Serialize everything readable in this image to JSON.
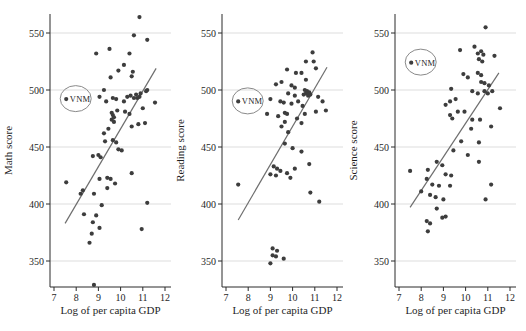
{
  "figure": {
    "width": 526,
    "height": 331,
    "background": "#ffffff",
    "dot_color": "#3d3d3d",
    "fit_line_color": "#6e6e6e",
    "grid_color": "#d9d9d9",
    "axis_color": "#2b2b2b",
    "text_color": "#1f1f1f",
    "annotation_circle_color": "#8a8a8a"
  },
  "chart_data": [
    {
      "type": "scatter",
      "ylabel": "Math score",
      "xlabel": "Log of per capita GDP",
      "xticks": [
        7,
        8,
        9,
        10,
        11,
        12
      ],
      "yticks": [
        350,
        400,
        450,
        500,
        550
      ],
      "xlim": [
        6.8,
        12.3
      ],
      "ylim": [
        327,
        567
      ],
      "grid": "horizontal",
      "legend": "none",
      "annotation": {
        "label": "VNM",
        "x": 7.55,
        "y": 492
      },
      "fit_line": {
        "x1": 7.5,
        "y1": 383,
        "x2": 11.6,
        "y2": 519
      },
      "points": [
        [
          7.55,
          419
        ],
        [
          7.55,
          492
        ],
        [
          8.2,
          409
        ],
        [
          8.3,
          412
        ],
        [
          8.35,
          391
        ],
        [
          8.6,
          366
        ],
        [
          8.7,
          374
        ],
        [
          8.75,
          384
        ],
        [
          8.75,
          442
        ],
        [
          8.8,
          329
        ],
        [
          8.8,
          409
        ],
        [
          8.9,
          532
        ],
        [
          8.9,
          390
        ],
        [
          9.0,
          443
        ],
        [
          9.05,
          379
        ],
        [
          9.05,
          422
        ],
        [
          9.05,
          494
        ],
        [
          9.1,
          441
        ],
        [
          9.15,
          399
        ],
        [
          9.25,
          500
        ],
        [
          9.25,
          462
        ],
        [
          9.3,
          455
        ],
        [
          9.35,
          490
        ],
        [
          9.4,
          414
        ],
        [
          9.4,
          423
        ],
        [
          9.45,
          466
        ],
        [
          9.5,
          536
        ],
        [
          9.55,
          422
        ],
        [
          9.55,
          511
        ],
        [
          9.6,
          480
        ],
        [
          9.6,
          474
        ],
        [
          9.65,
          478
        ],
        [
          9.65,
          493
        ],
        [
          9.65,
          456
        ],
        [
          9.7,
          476
        ],
        [
          9.7,
          472
        ],
        [
          9.75,
          418
        ],
        [
          9.8,
          454
        ],
        [
          9.8,
          492
        ],
        [
          9.85,
          482
        ],
        [
          9.9,
          517
        ],
        [
          9.9,
          448
        ],
        [
          10.05,
          447
        ],
        [
          10.15,
          490
        ],
        [
          10.15,
          522
        ],
        [
          10.2,
          481
        ],
        [
          10.3,
          494
        ],
        [
          10.4,
          532
        ],
        [
          10.4,
          479
        ],
        [
          10.45,
          495
        ],
        [
          10.5,
          427
        ],
        [
          10.5,
          468
        ],
        [
          10.5,
          512
        ],
        [
          10.55,
          516
        ],
        [
          10.6,
          493
        ],
        [
          10.6,
          548
        ],
        [
          10.7,
          496
        ],
        [
          10.75,
          493
        ],
        [
          10.8,
          470
        ],
        [
          10.85,
          494
        ],
        [
          10.85,
          564
        ],
        [
          10.9,
          497
        ],
        [
          10.95,
          378
        ],
        [
          11.0,
          484
        ],
        [
          11.1,
          471
        ],
        [
          11.15,
          499
        ],
        [
          11.2,
          401
        ],
        [
          11.2,
          500
        ],
        [
          11.2,
          544
        ],
        [
          11.55,
          489
        ]
      ]
    },
    {
      "type": "scatter",
      "ylabel": "Reading score",
      "xlabel": "Log of per capita GDP",
      "xticks": [
        7,
        8,
        9,
        10,
        11,
        12
      ],
      "yticks": [
        350,
        400,
        450,
        500,
        550
      ],
      "xlim": [
        6.8,
        12.3
      ],
      "ylim": [
        327,
        567
      ],
      "grid": "horizontal",
      "legend": "none",
      "annotation": {
        "label": "VNM",
        "x": 7.55,
        "y": 490
      },
      "fit_line": {
        "x1": 7.55,
        "y1": 386,
        "x2": 11.55,
        "y2": 520
      },
      "points": [
        [
          7.55,
          417
        ],
        [
          7.55,
          490
        ],
        [
          9.0,
          348
        ],
        [
          9.1,
          361
        ],
        [
          9.1,
          355
        ],
        [
          9.25,
          354
        ],
        [
          9.3,
          359
        ],
        [
          9.6,
          352
        ],
        [
          9.0,
          426
        ],
        [
          9.25,
          425
        ],
        [
          9.15,
          433
        ],
        [
          9.3,
          431
        ],
        [
          9.45,
          429
        ],
        [
          9.75,
          427
        ],
        [
          9.9,
          423
        ],
        [
          10.1,
          431
        ],
        [
          10.75,
          435
        ],
        [
          9.65,
          453
        ],
        [
          10.0,
          449
        ],
        [
          10.4,
          446
        ],
        [
          9.5,
          468
        ],
        [
          9.8,
          463
        ],
        [
          9.65,
          472
        ],
        [
          9.65,
          480
        ],
        [
          9.75,
          479
        ],
        [
          10.55,
          479
        ],
        [
          11.05,
          481
        ],
        [
          10.2,
          475
        ],
        [
          10.4,
          471
        ],
        [
          9.35,
          477
        ],
        [
          8.85,
          479
        ],
        [
          9.25,
          505
        ],
        [
          9.5,
          507
        ],
        [
          9.0,
          492
        ],
        [
          9.45,
          490
        ],
        [
          9.6,
          489
        ],
        [
          9.8,
          497
        ],
        [
          10.1,
          495
        ],
        [
          9.95,
          488
        ],
        [
          10.1,
          502
        ],
        [
          10.25,
          490
        ],
        [
          10.45,
          486
        ],
        [
          10.55,
          500
        ],
        [
          10.65,
          499
        ],
        [
          10.6,
          497
        ],
        [
          10.75,
          498
        ],
        [
          10.7,
          495
        ],
        [
          10.8,
          496
        ],
        [
          10.5,
          496
        ],
        [
          11.15,
          494
        ],
        [
          11.35,
          490
        ],
        [
          11.5,
          482
        ],
        [
          10.9,
          533
        ],
        [
          10.6,
          525
        ],
        [
          10.95,
          525
        ],
        [
          11.05,
          519
        ],
        [
          9.75,
          518
        ],
        [
          10.15,
          515
        ],
        [
          10.4,
          515
        ],
        [
          10.6,
          509
        ],
        [
          9.95,
          504
        ],
        [
          11.2,
          402
        ],
        [
          10.8,
          410
        ]
      ]
    },
    {
      "type": "scatter",
      "ylabel": "Science score",
      "xlabel": "Log of per capita GDP",
      "xticks": [
        7,
        8,
        9,
        10,
        11,
        12
      ],
      "yticks": [
        350,
        400,
        450,
        500,
        550
      ],
      "xlim": [
        6.8,
        12.3
      ],
      "ylim": [
        327,
        567
      ],
      "grid": "horizontal",
      "legend": "none",
      "annotation": {
        "label": "VNM",
        "x": 7.55,
        "y": 524
      },
      "fit_line": {
        "x1": 7.5,
        "y1": 397,
        "x2": 11.5,
        "y2": 515
      },
      "points": [
        [
          7.5,
          429
        ],
        [
          7.55,
          524
        ],
        [
          8.0,
          411
        ],
        [
          8.25,
          385
        ],
        [
          8.25,
          422
        ],
        [
          8.3,
          376
        ],
        [
          8.3,
          430
        ],
        [
          8.4,
          383
        ],
        [
          8.4,
          408
        ],
        [
          8.5,
          417
        ],
        [
          8.65,
          406
        ],
        [
          8.7,
          396
        ],
        [
          8.7,
          437
        ],
        [
          8.8,
          416
        ],
        [
          8.95,
          434
        ],
        [
          8.95,
          388
        ],
        [
          9.0,
          404
        ],
        [
          9.1,
          426
        ],
        [
          9.1,
          389
        ],
        [
          9.3,
          416
        ],
        [
          9.35,
          425
        ],
        [
          9.1,
          487
        ],
        [
          9.3,
          490
        ],
        [
          9.35,
          501
        ],
        [
          9.55,
          492
        ],
        [
          9.3,
          478
        ],
        [
          9.4,
          475
        ],
        [
          9.45,
          447
        ],
        [
          9.65,
          481
        ],
        [
          9.75,
          535
        ],
        [
          9.8,
          455
        ],
        [
          9.9,
          514
        ],
        [
          9.95,
          481
        ],
        [
          10.1,
          443
        ],
        [
          10.1,
          511
        ],
        [
          10.25,
          466
        ],
        [
          10.3,
          499
        ],
        [
          10.3,
          474
        ],
        [
          10.4,
          538
        ],
        [
          10.55,
          515
        ],
        [
          10.55,
          497
        ],
        [
          10.6,
          454
        ],
        [
          10.6,
          437
        ],
        [
          10.65,
          474
        ],
        [
          10.7,
          513
        ],
        [
          10.7,
          507
        ],
        [
          10.55,
          532
        ],
        [
          10.7,
          534
        ],
        [
          10.8,
          531
        ],
        [
          10.6,
          527
        ],
        [
          10.75,
          525
        ],
        [
          10.85,
          506
        ],
        [
          10.85,
          499
        ],
        [
          10.9,
          555
        ],
        [
          11.0,
          497
        ],
        [
          11.05,
          504
        ],
        [
          11.15,
          468
        ],
        [
          11.2,
          499
        ],
        [
          11.3,
          530
        ],
        [
          10.9,
          404
        ],
        [
          11.15,
          417
        ],
        [
          11.55,
          484
        ]
      ]
    }
  ],
  "panel_layout": {
    "tick7_x": [
      54,
      226,
      399
    ],
    "px_per_unit_x": 22.2,
    "y_top_550": 33,
    "px_per_score": 1.14,
    "axis_bottom_y": 287,
    "plot_top_y": 14,
    "plot_width": 121
  }
}
